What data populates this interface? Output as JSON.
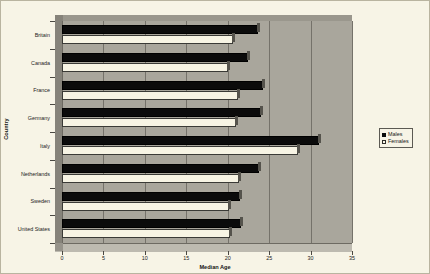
{
  "chart_data": {
    "type": "bar",
    "orientation": "horizontal",
    "title": "",
    "xlabel": "Median Age",
    "ylabel": "Country",
    "xlim": [
      0,
      35
    ],
    "xticks": [
      0,
      5,
      10,
      15,
      20,
      25,
      30,
      35
    ],
    "grid": true,
    "legend_position": "right",
    "categories": [
      "Britain",
      "Canada",
      "France",
      "Germany",
      "Italy",
      "Netherlands",
      "Sweden",
      "United States"
    ],
    "series": [
      {
        "name": "Males",
        "color": "#0b0b0b",
        "values": [
          23.7,
          22.5,
          24.2,
          24.0,
          31.0,
          23.8,
          21.5,
          21.6
        ]
      },
      {
        "name": "Females",
        "color": "#f7f4e4",
        "values": [
          20.6,
          20.0,
          21.2,
          21.0,
          28.5,
          21.4,
          20.2,
          20.3
        ]
      }
    ]
  },
  "legend": {
    "items": [
      {
        "label": "Males"
      },
      {
        "label": "Females"
      }
    ]
  },
  "colors": {
    "background": "#f7f4e6",
    "plot_area": "#a9a69c",
    "gridline": "#75726a",
    "males": "#0b0b0b",
    "females": "#f7f4e4",
    "axis_text": "#1b1b1b"
  }
}
